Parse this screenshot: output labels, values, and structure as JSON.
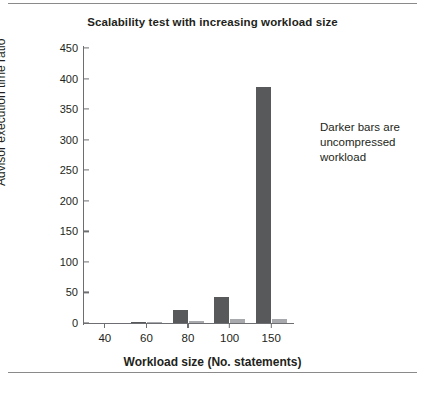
{
  "figure": {
    "annotation_lines": [
      "Darker bars are",
      "uncompressed",
      "workload"
    ]
  },
  "chart_data": {
    "type": "bar",
    "title": "Scalability test with increasing workload size",
    "xlabel": "Workload size (No. statements)",
    "ylabel": "Advisor execution time ratio",
    "categories": [
      "40",
      "60",
      "80",
      "100",
      "150"
    ],
    "series": [
      {
        "name": "uncompressed workload",
        "color": "#58595b",
        "values": [
          0,
          1.5,
          22,
          43,
          386
        ]
      },
      {
        "name": "compressed workload",
        "color": "#a7a9ac",
        "values": [
          0,
          0.8,
          3,
          7,
          7
        ]
      }
    ],
    "ylim": [
      0,
      450
    ],
    "yticks": [
      0,
      50,
      100,
      150,
      200,
      250,
      300,
      350,
      400,
      450
    ],
    "ytick_labels": [
      "0",
      "50",
      "100",
      "150",
      "200",
      "250",
      "300",
      "350",
      "400",
      "450"
    ],
    "xtick_labels": [
      "40",
      "60",
      "80",
      "100",
      "150"
    ],
    "grid": false,
    "legend": "none",
    "annotation": "Darker bars are uncompressed workload"
  }
}
